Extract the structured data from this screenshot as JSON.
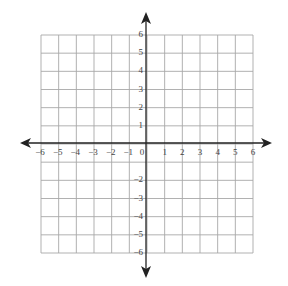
{
  "diagram": {
    "type": "coordinate-plane",
    "colors": {
      "grid": "#a8a8a8",
      "axis": "#222222",
      "label": "#444444",
      "background": "#ffffff"
    },
    "x_axis": {
      "min": -6,
      "max": 6,
      "step": 1,
      "arrows": true
    },
    "y_axis": {
      "min": -6,
      "max": 6,
      "step": 1,
      "arrows": true
    },
    "x_labels": [
      "−6",
      "−5",
      "−4",
      "−3",
      "−2",
      "−1",
      "0",
      "1",
      "2",
      "3",
      "4",
      "5",
      "6"
    ],
    "y_labels_positive": [
      "1",
      "2",
      "3",
      "4",
      "5",
      "6"
    ],
    "y_labels_negative": [
      "−2",
      "−3",
      "−4",
      "−5",
      "−6"
    ],
    "origin_label": "0"
  }
}
